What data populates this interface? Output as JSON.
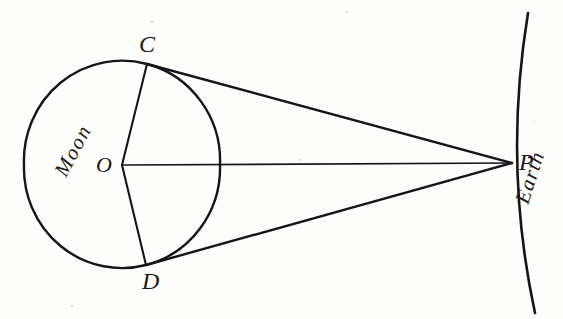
{
  "figure": {
    "name": "moon-earth-parallax-diagram",
    "caption_points": [
      "C",
      "O",
      "D",
      "P"
    ],
    "background_color": "#fdfdfb",
    "ink_color": "#15141a"
  },
  "labels": {
    "moon": "Moon",
    "earth": "Earth",
    "point_c": "C",
    "point_o": "O",
    "point_d": "D",
    "point_p": "P"
  },
  "geometry": {
    "moon_circle": {
      "cx": 122,
      "cy": 165,
      "r": 98
    },
    "earth_arc": {
      "start_x": 528,
      "start_y": 13,
      "end_x": 535,
      "end_y": 313,
      "bulge_x": 508
    },
    "point_c": {
      "x": 147,
      "y": 64
    },
    "point_o": {
      "x": 122,
      "y": 165
    },
    "point_d": {
      "x": 146,
      "y": 265
    },
    "point_p": {
      "x": 512,
      "y": 163
    }
  },
  "label_positions": {
    "moon": {
      "x": 66,
      "y": 178,
      "rotation": -62,
      "font_size": 21
    },
    "earth": {
      "x": 528,
      "y": 205,
      "rotation": -72,
      "font_size": 21
    },
    "point_c": {
      "x": 139,
      "y": 52,
      "font_size": 24
    },
    "point_o": {
      "x": 96,
      "y": 172,
      "font_size": 22
    },
    "point_d": {
      "x": 142,
      "y": 289,
      "font_size": 24
    },
    "point_p": {
      "x": 519,
      "y": 170,
      "font_size": 24
    }
  }
}
